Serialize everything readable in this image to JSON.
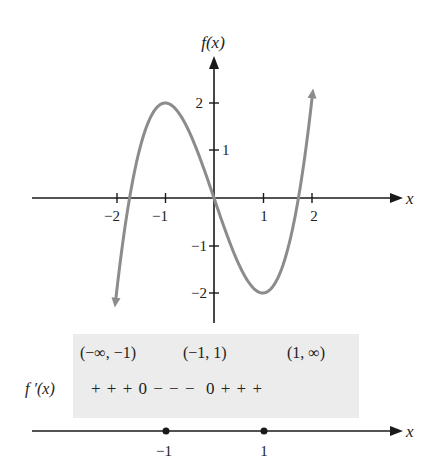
{
  "chart_data": {
    "type": "line",
    "title": "",
    "function": "f(x) = x^3 - 3x",
    "xlabel": "x",
    "ylabel": "f(x)",
    "xticks": [
      -2,
      -1,
      1,
      2
    ],
    "yticks": [
      -2,
      -1,
      1,
      2
    ],
    "xlim": [
      -2.02,
      2.02
    ],
    "series": [
      {
        "name": "f(x)",
        "x": [
          -2.02,
          -1.75,
          -1.5,
          -1.25,
          -1.0,
          -0.75,
          -0.5,
          -0.25,
          0.0,
          0.25,
          0.5,
          0.75,
          1.0,
          1.25,
          1.5,
          1.75,
          2.02
        ],
        "y": [
          -2.18,
          -0.11,
          1.13,
          1.8,
          2.0,
          1.83,
          1.38,
          0.73,
          0.0,
          -0.73,
          -1.38,
          -1.83,
          -2.0,
          -1.8,
          -1.13,
          0.11,
          2.18
        ]
      }
    ],
    "key_points": {
      "local_max": [
        -1,
        2
      ],
      "local_min": [
        1,
        -2
      ],
      "origin": [
        0,
        0
      ]
    },
    "grid": false,
    "curve_color": "#8c8c8c",
    "axis_color": "#1a1a1a"
  },
  "graph": {
    "y_axis_label": "f(x)",
    "x_axis_label": "x",
    "x_tick_labels": [
      "−2",
      "−1",
      "1",
      "2"
    ],
    "y_tick_labels": [
      "2",
      "1",
      "−1",
      "−2"
    ]
  },
  "sign_chart": {
    "intervals": [
      "(−∞, −1)",
      "(−1, 1)",
      "(1, ∞)"
    ],
    "row_label": "f ′(x)",
    "signs": "+ + + 0 − − −  0 + + +",
    "number_line_label": "x",
    "critical_points": [
      "−1",
      "1"
    ],
    "box_color": "#ececec"
  }
}
